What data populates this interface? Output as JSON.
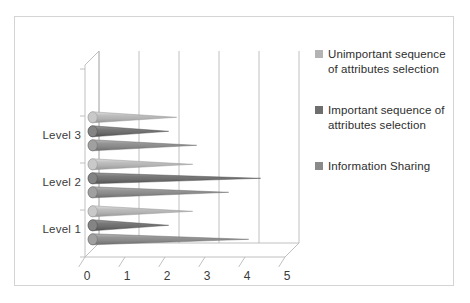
{
  "chart_data": {
    "type": "bar",
    "title": "",
    "xlabel": "",
    "ylabel": "",
    "categories": [
      "Level 1",
      "Level 2",
      "Level 3"
    ],
    "xlim": [
      0,
      5
    ],
    "xticks": [
      "0",
      "1",
      "2",
      "3",
      "4",
      "5"
    ],
    "grid": true,
    "legend_position": "right",
    "style": "3d-cone-horizontal",
    "series": [
      {
        "name": "Unimportant sequence of attributes selection",
        "color": "#b3b3b3",
        "values": [
          2.5,
          2.5,
          2.1
        ]
      },
      {
        "name": "Important sequence of attributes selection",
        "color": "#6e6e6e",
        "values": [
          1.9,
          4.2,
          1.9
        ]
      },
      {
        "name": "Information Sharing",
        "color": "#8a8a8a",
        "values": [
          3.9,
          3.4,
          2.6
        ]
      }
    ]
  },
  "legend": {
    "items": [
      {
        "label": "Unimportant sequence of attributes selection",
        "color": "#b3b3b3"
      },
      {
        "label": "Important sequence of attributes selection",
        "color": "#6e6e6e"
      },
      {
        "label": "Information Sharing",
        "color": "#8a8a8a"
      }
    ]
  },
  "axis": {
    "categories": [
      "Level 3",
      "Level 2",
      "Level 1"
    ],
    "xticks": [
      "0",
      "1",
      "2",
      "3",
      "4",
      "5"
    ]
  }
}
